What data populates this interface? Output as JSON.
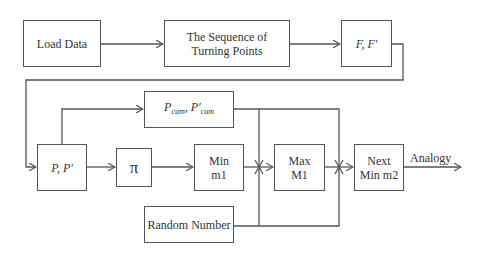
{
  "diagram": {
    "nodes": {
      "load_data": "Load Data",
      "sequence": "The Sequence of Turning Points",
      "f_fprime": "F, F'",
      "p_pprime": "P, P'",
      "pi": "π",
      "pcum": "Pcum, P'cum",
      "pcum_parts": {
        "p": "P",
        "cum": "cum",
        "sep": ", ",
        "pp": "P'",
        "cum2": "cum"
      },
      "min_m1": "Min m1",
      "min_m1_lines": [
        "Min",
        "m1"
      ],
      "max_m1": "Max M1",
      "max_m1_lines": [
        "Max",
        "M1"
      ],
      "next_min_m2": "Next Min m2",
      "next_min_m2_lines": [
        "Next",
        "Min m2"
      ],
      "random_number": "Random Number",
      "sequence_lines": [
        "The Sequence of",
        "Turning Points"
      ]
    },
    "output_label": "Analogy",
    "edges": [
      [
        "Load Data",
        "The Sequence of Turning Points"
      ],
      [
        "The Sequence of Turning Points",
        "F, F'"
      ],
      [
        "F, F'",
        "P, P'"
      ],
      [
        "P, P'",
        "π"
      ],
      [
        "P, P'",
        "Pcum, P'cum"
      ],
      [
        "π",
        "Min m1"
      ],
      [
        "Min m1",
        "Max M1"
      ],
      [
        "Max M1",
        "Next Min m2"
      ],
      [
        "Pcum, P'cum",
        "Max M1"
      ],
      [
        "Pcum, P'cum",
        "Next Min m2"
      ],
      [
        "Random Number",
        "Max M1"
      ],
      [
        "Random Number",
        "Next Min m2"
      ],
      [
        "Next Min m2",
        "Analogy"
      ]
    ],
    "line_color": "#555555"
  }
}
